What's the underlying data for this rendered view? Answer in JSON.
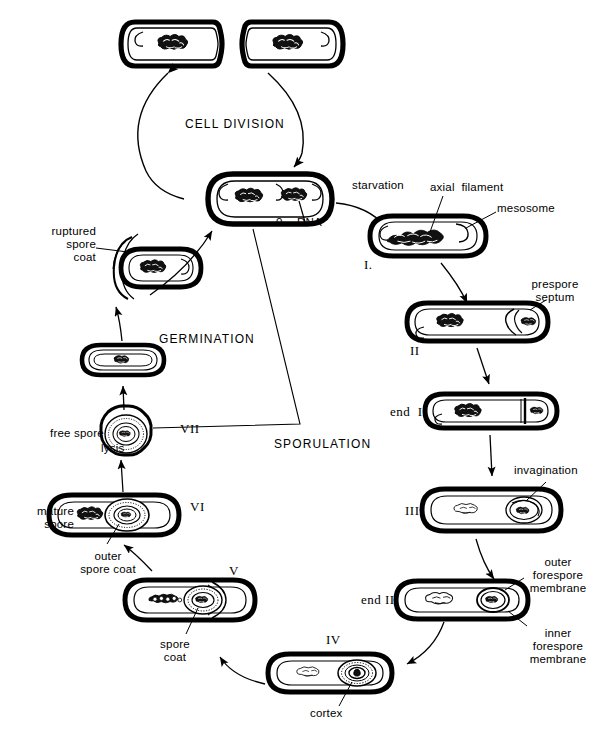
{
  "figure": {
    "title_visible": false,
    "background_color": "#ffffff",
    "ink_color": "#000000",
    "width": 601,
    "height": 738
  },
  "cycle_labels": {
    "cell_division": "CELL DIVISION",
    "germination": "GERMINATION",
    "sporulation": "SPORULATION"
  },
  "transition_labels": {
    "starvation": "starvation",
    "lysis": "lysis"
  },
  "stage_numerals": {
    "one": "I.",
    "two": "II",
    "end_two": "end  II",
    "three": "III",
    "end_three": "end III",
    "four": "IV",
    "five": "V",
    "six": "VI",
    "seven": "VII"
  },
  "structure_labels": {
    "origin": "0",
    "dna": "DNA",
    "axial_filament": "axial  filament",
    "mesosome": "mesosome",
    "prespore_septum": "prespore\nseptum",
    "invagination": "invagination",
    "outer_forespore_membrane": "outer\nforespore\nmembrane",
    "inner_forespore_membrane": "inner\nforespore\nmembrane",
    "cortex": "cortex",
    "spore_coat": "spore\ncoat",
    "outer_spore_coat": "outer\nspore coat",
    "mature_spore": "mature\nspore",
    "free_spore": "free spore",
    "ruptured_spore_coat": "ruptured\nspore\ncoat"
  },
  "cells": [
    {
      "id": "dividing-cell",
      "stage": "dividing pair",
      "cx": 232,
      "cy": 44
    },
    {
      "id": "vegetative-cell",
      "stage": "vegetative",
      "cx": 270,
      "cy": 199
    },
    {
      "id": "stage-i-cell",
      "stage": "I",
      "cx": 428,
      "cy": 236
    },
    {
      "id": "stage-ii-cell",
      "stage": "II",
      "cx": 477,
      "cy": 322
    },
    {
      "id": "end-ii-cell",
      "stage": "end II",
      "cx": 490,
      "cy": 411
    },
    {
      "id": "stage-iii-cell",
      "stage": "III",
      "cx": 491,
      "cy": 510
    },
    {
      "id": "end-iii-cell",
      "stage": "end III",
      "cx": 462,
      "cy": 600
    },
    {
      "id": "stage-iv-cell",
      "stage": "IV",
      "cx": 330,
      "cy": 673
    },
    {
      "id": "stage-v-cell",
      "stage": "V",
      "cx": 190,
      "cy": 600
    },
    {
      "id": "stage-vi-cell",
      "stage": "VI",
      "cx": 108,
      "cy": 515
    },
    {
      "id": "stage-vii-spore",
      "stage": "VII free spore",
      "cx": 125,
      "cy": 434
    },
    {
      "id": "germinating-spore",
      "stage": "germinating",
      "cx": 123,
      "cy": 360
    },
    {
      "id": "ruptured-spore-cell",
      "stage": "outgrowth",
      "cx": 155,
      "cy": 268
    }
  ]
}
